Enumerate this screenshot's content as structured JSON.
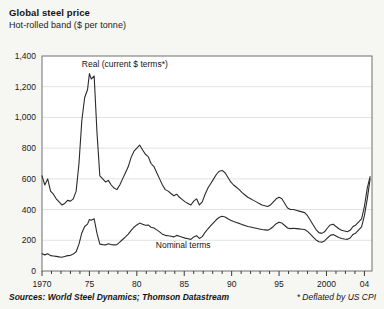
{
  "header": {
    "title": "Global steel price",
    "subtitle": "Hot-rolled band ($ per tonne)"
  },
  "footer": {
    "sources": "Sources: World Steel Dynamics; Thomson Datastream",
    "note": "* Deflated by US CPI"
  },
  "style": {
    "background": "#f6f6f3",
    "plot_background": "#ffffff",
    "frame_color": "#6e6e6e",
    "grid_color": "#e2e2e2",
    "line_color": "#2a2a2a"
  },
  "chart_data": {
    "type": "line",
    "title": "Global steel price",
    "subtitle": "Hot-rolled band ($ per tonne)",
    "xlabel": "",
    "ylabel": "",
    "xlim": [
      1970,
      2004.8
    ],
    "ylim": [
      0,
      1400
    ],
    "yticks": [
      0,
      200,
      400,
      600,
      800,
      1000,
      1200,
      1400
    ],
    "ytick_labels": [
      "0",
      "200",
      "400",
      "600",
      "800",
      "1,000",
      "1,200",
      "1,400"
    ],
    "xticks": [
      1970,
      1975,
      1980,
      1985,
      1990,
      1995,
      2000,
      2004
    ],
    "xtick_labels": [
      "1970",
      "75",
      "80",
      "85",
      "90",
      "95",
      "2000",
      "04"
    ],
    "minor_xtick_interval": 1,
    "grid": "horizontal",
    "legend": "inline-annotations",
    "annotations": [
      {
        "text": "Real (current $ terms*)",
        "x": 1974.2,
        "y": 1330
      },
      {
        "text": "Nominal terms",
        "x": 1982.0,
        "y": 148
      }
    ],
    "series": [
      {
        "name": "Real (current $ terms*)",
        "label": "Real (current $ terms*)",
        "x": [
          1970.0,
          1970.3,
          1970.6,
          1970.9,
          1971.2,
          1971.5,
          1971.8,
          1972.1,
          1972.4,
          1972.7,
          1973.0,
          1973.3,
          1973.6,
          1973.9,
          1974.2,
          1974.5,
          1974.8,
          1975.0,
          1975.2,
          1975.5,
          1975.8,
          1976.1,
          1976.4,
          1976.7,
          1977.0,
          1977.3,
          1977.6,
          1977.9,
          1978.2,
          1978.5,
          1978.8,
          1979.1,
          1979.4,
          1979.7,
          1980.0,
          1980.3,
          1980.6,
          1980.9,
          1981.2,
          1981.5,
          1981.8,
          1982.1,
          1982.4,
          1982.7,
          1983.0,
          1983.3,
          1983.6,
          1983.9,
          1984.2,
          1984.5,
          1984.8,
          1985.1,
          1985.4,
          1985.7,
          1986.0,
          1986.3,
          1986.6,
          1986.9,
          1987.2,
          1987.5,
          1987.8,
          1988.1,
          1988.4,
          1988.7,
          1989.0,
          1989.3,
          1989.6,
          1989.9,
          1990.2,
          1990.5,
          1990.8,
          1991.1,
          1991.4,
          1991.7,
          1992.0,
          1992.3,
          1992.6,
          1992.9,
          1993.2,
          1993.5,
          1993.8,
          1994.1,
          1994.4,
          1994.7,
          1995.0,
          1995.3,
          1995.6,
          1995.9,
          1996.2,
          1996.5,
          1996.8,
          1997.1,
          1997.4,
          1997.7,
          1998.0,
          1998.3,
          1998.6,
          1998.9,
          1999.2,
          1999.5,
          1999.8,
          2000.1,
          2000.4,
          2000.7,
          2001.0,
          2001.3,
          2001.6,
          2001.9,
          2002.2,
          2002.5,
          2002.8,
          2003.1,
          2003.4,
          2003.7,
          2004.0,
          2004.3,
          2004.6
        ],
        "y": [
          620,
          560,
          600,
          520,
          500,
          470,
          450,
          430,
          440,
          460,
          455,
          470,
          520,
          700,
          980,
          1130,
          1180,
          1285,
          1250,
          1270,
          900,
          620,
          600,
          580,
          590,
          560,
          540,
          530,
          560,
          600,
          640,
          680,
          740,
          780,
          800,
          820,
          790,
          760,
          745,
          700,
          680,
          640,
          600,
          560,
          530,
          520,
          505,
          490,
          500,
          480,
          465,
          450,
          440,
          430,
          455,
          470,
          430,
          450,
          500,
          540,
          570,
          600,
          630,
          650,
          655,
          640,
          610,
          580,
          560,
          545,
          530,
          510,
          495,
          480,
          470,
          460,
          450,
          440,
          430,
          425,
          420,
          430,
          450,
          470,
          480,
          470,
          440,
          410,
          400,
          400,
          395,
          390,
          385,
          380,
          360,
          330,
          300,
          270,
          250,
          245,
          255,
          280,
          300,
          305,
          290,
          275,
          265,
          260,
          255,
          265,
          290,
          300,
          320,
          340,
          420,
          540,
          615
        ]
      },
      {
        "name": "Nominal terms",
        "label": "Nominal terms",
        "x": [
          1970.0,
          1970.3,
          1970.6,
          1970.9,
          1971.2,
          1971.5,
          1971.8,
          1972.1,
          1972.4,
          1972.7,
          1973.0,
          1973.3,
          1973.6,
          1973.9,
          1974.2,
          1974.5,
          1974.8,
          1975.0,
          1975.2,
          1975.5,
          1975.8,
          1976.1,
          1976.4,
          1976.7,
          1977.0,
          1977.3,
          1977.6,
          1977.9,
          1978.2,
          1978.5,
          1978.8,
          1979.1,
          1979.4,
          1979.7,
          1980.0,
          1980.3,
          1980.6,
          1980.9,
          1981.2,
          1981.5,
          1981.8,
          1982.1,
          1982.4,
          1982.7,
          1983.0,
          1983.3,
          1983.6,
          1983.9,
          1984.2,
          1984.5,
          1984.8,
          1985.1,
          1985.4,
          1985.7,
          1986.0,
          1986.3,
          1986.6,
          1986.9,
          1987.2,
          1987.5,
          1987.8,
          1988.1,
          1988.4,
          1988.7,
          1989.0,
          1989.3,
          1989.6,
          1989.9,
          1990.2,
          1990.5,
          1990.8,
          1991.1,
          1991.4,
          1991.7,
          1992.0,
          1992.3,
          1992.6,
          1992.9,
          1993.2,
          1993.5,
          1993.8,
          1994.1,
          1994.4,
          1994.7,
          1995.0,
          1995.3,
          1995.6,
          1995.9,
          1996.2,
          1996.5,
          1996.8,
          1997.1,
          1997.4,
          1997.7,
          1998.0,
          1998.3,
          1998.6,
          1998.9,
          1999.2,
          1999.5,
          1999.8,
          2000.1,
          2000.4,
          2000.7,
          2001.0,
          2001.3,
          2001.6,
          2001.9,
          2002.2,
          2002.5,
          2002.8,
          2003.1,
          2003.4,
          2003.7,
          2004.0,
          2004.3,
          2004.6
        ],
        "y": [
          112,
          105,
          112,
          100,
          98,
          95,
          92,
          90,
          95,
          100,
          102,
          110,
          125,
          175,
          248,
          290,
          305,
          335,
          330,
          340,
          245,
          175,
          172,
          170,
          178,
          172,
          170,
          172,
          188,
          205,
          222,
          240,
          265,
          285,
          300,
          312,
          305,
          298,
          300,
          285,
          280,
          268,
          255,
          240,
          232,
          230,
          226,
          222,
          232,
          226,
          220,
          214,
          210,
          206,
          222,
          230,
          212,
          224,
          252,
          275,
          295,
          315,
          335,
          350,
          356,
          352,
          340,
          330,
          322,
          316,
          310,
          302,
          296,
          290,
          286,
          282,
          278,
          274,
          270,
          268,
          266,
          275,
          290,
          308,
          318,
          312,
          296,
          280,
          276,
          278,
          276,
          274,
          272,
          270,
          258,
          240,
          220,
          202,
          190,
          188,
          196,
          215,
          232,
          238,
          228,
          218,
          212,
          208,
          206,
          215,
          238,
          248,
          268,
          288,
          360,
          470,
          600
        ]
      }
    ]
  }
}
